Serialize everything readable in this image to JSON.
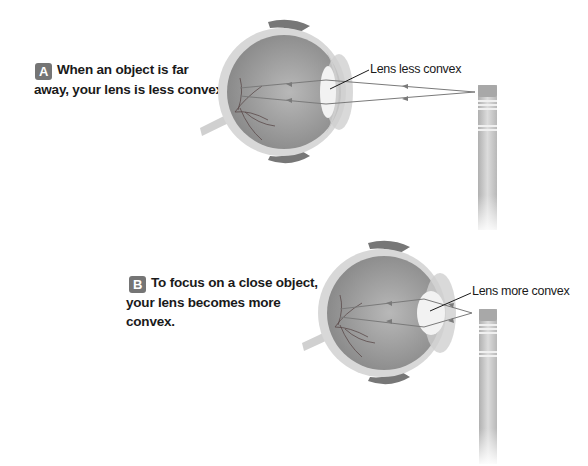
{
  "panels": [
    {
      "id": "A",
      "badge": "A",
      "caption_line1": "When an object is far",
      "caption_line2": "away,  your lens is less convex.",
      "lens_label": "Lens less convex",
      "lens_state": "less convex",
      "object": "pencil (far)"
    },
    {
      "id": "B",
      "badge": "B",
      "caption_line1": "To focus on a close object,",
      "caption_line2": "your lens becomes more convex.",
      "lens_label": "Lens more convex",
      "lens_state": "more convex",
      "object": "pencil (close)"
    }
  ],
  "colors": {
    "badge_bg": "#757575",
    "eye_interior": "#9a9a9a",
    "light_ray": "#7a7a7a",
    "pencil": "#c8c8c8"
  }
}
